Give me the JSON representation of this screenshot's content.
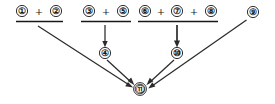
{
  "diagram": {
    "type": "dependency-convergence-diagram",
    "width": 275,
    "height": 104,
    "background_color": "#ffffff",
    "ink_color": "#181818",
    "edge_color": "#2b2b2b",
    "groups": [
      {
        "id": "group-1",
        "members": [
          "①",
          "②"
        ],
        "operator": "+",
        "expression": "① + ②",
        "bar": {
          "x1": 16,
          "x2": 63,
          "y": 21
        }
      },
      {
        "id": "group-2",
        "members": [
          "③",
          "⑤"
        ],
        "operator": "+",
        "expression": "③ + ⑤",
        "bar": {
          "x1": 81,
          "x2": 131,
          "y": 21
        }
      },
      {
        "id": "group-3",
        "members": [
          "⑥",
          "⑦",
          "⑧"
        ],
        "operator": "+",
        "expression": "⑥ + ⑦ + ⑧",
        "bar": {
          "x1": 138,
          "x2": 218,
          "y": 21
        }
      }
    ],
    "nodes": [
      {
        "id": "n1",
        "label": "①",
        "x": 22,
        "y": 11,
        "r": 5.6,
        "double": false,
        "row": "top"
      },
      {
        "id": "n2",
        "label": "②",
        "x": 56,
        "y": 11,
        "r": 5.6,
        "double": false,
        "row": "top"
      },
      {
        "id": "n3",
        "label": "③",
        "x": 89,
        "y": 11,
        "r": 5.6,
        "double": false,
        "row": "top"
      },
      {
        "id": "n5",
        "label": "⑤",
        "x": 123,
        "y": 11,
        "r": 5.6,
        "double": false,
        "row": "top"
      },
      {
        "id": "n6",
        "label": "⑥",
        "x": 145,
        "y": 11,
        "r": 5.6,
        "double": false,
        "row": "top"
      },
      {
        "id": "n7",
        "label": "⑦",
        "x": 177,
        "y": 11,
        "r": 5.6,
        "double": false,
        "row": "top"
      },
      {
        "id": "n8",
        "label": "⑧",
        "x": 211,
        "y": 11,
        "r": 5.6,
        "double": false,
        "row": "top"
      },
      {
        "id": "n9",
        "label": "⑨",
        "x": 253,
        "y": 12,
        "r": 5.6,
        "double": false,
        "row": "top"
      },
      {
        "id": "n4",
        "label": "④",
        "x": 105,
        "y": 53,
        "r": 5.6,
        "double": false,
        "row": "middle"
      },
      {
        "id": "n10",
        "label": "⑩",
        "x": 177,
        "y": 53,
        "r": 5.6,
        "double": false,
        "row": "middle"
      },
      {
        "id": "n11",
        "label": "⑪",
        "x": 140,
        "y": 89,
        "r": 5.8,
        "double": true,
        "row": "bottom"
      }
    ],
    "operators": [
      {
        "id": "op-1",
        "symbol": "+",
        "x": 39,
        "y": 11
      },
      {
        "id": "op-2",
        "symbol": "+",
        "x": 106,
        "y": 11
      },
      {
        "id": "op-3",
        "symbol": "+",
        "x": 161,
        "y": 11
      },
      {
        "id": "op-4",
        "symbol": "+",
        "x": 194,
        "y": 11
      }
    ],
    "edges": [
      {
        "id": "edge-group1-to-11",
        "from": "group-1",
        "to": "n11",
        "style": "straight-arrow",
        "x1": 38,
        "y1": 26,
        "x2": 131,
        "y2": 86
      },
      {
        "id": "edge-group2-to-4",
        "from": "group-2",
        "to": "n4",
        "style": "vertical-arrow",
        "x1": 105,
        "y1": 25,
        "x2": 105,
        "y2": 46
      },
      {
        "id": "edge-4-to-11",
        "from": "n4",
        "to": "n11",
        "style": "straight-arrow",
        "x1": 105,
        "y1": 60,
        "x2": 133,
        "y2": 83
      },
      {
        "id": "edge-group3-to-10",
        "from": "group-3",
        "to": "n10",
        "style": "vertical-arrow",
        "x1": 177,
        "y1": 25,
        "x2": 177,
        "y2": 46
      },
      {
        "id": "edge-10-to-11",
        "from": "n10",
        "to": "n11",
        "style": "straight-arrow",
        "x1": 174,
        "y1": 60,
        "x2": 148,
        "y2": 83
      },
      {
        "id": "edge-9-to-11",
        "from": "n9",
        "to": "n11",
        "style": "straight-arrow",
        "x1": 246,
        "y1": 20,
        "x2": 150,
        "y2": 87
      }
    ]
  }
}
